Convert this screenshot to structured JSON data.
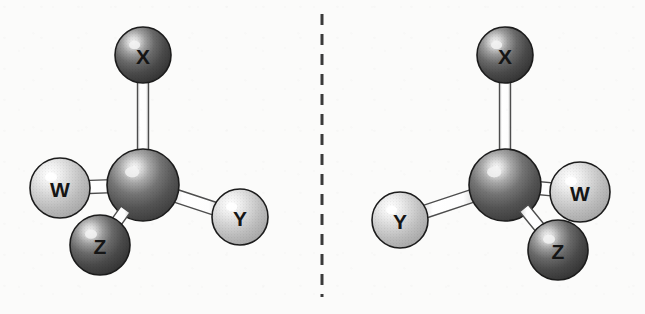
{
  "figure": {
    "type": "molecular-structure-pair",
    "background_color": "#fbfbfa",
    "divider": {
      "name": "mirror-plane",
      "style": "dashed",
      "orientation": "vertical",
      "color": "#3a3a3a",
      "x": 322,
      "y_start": 14,
      "y_end": 297,
      "dash": "11 9",
      "width": 3
    },
    "colors": {
      "dark_atom": "#4a4a4a",
      "dark_atom_highlight": "#f2f2f2",
      "light_atom": "#c9c9c9",
      "light_atom_highlight": "#ffffff",
      "central_atom": "#5d5d5d",
      "bond_fill": "#ffffff",
      "bond_stroke": "#4d4d4d",
      "outline": "#1c1c1c",
      "label_color": "#151515"
    },
    "molecules": [
      {
        "name": "molecule-left",
        "side": "left",
        "center_atom": {
          "name": "central-atom",
          "label": "",
          "cx": 143,
          "cy": 185,
          "r": 36,
          "shade": "central"
        },
        "atoms": [
          {
            "name": "atom-x",
            "label": "X",
            "cx": 143,
            "cy": 55,
            "r": 28,
            "shade": "dark",
            "font_size": 21
          },
          {
            "name": "atom-w",
            "label": "W",
            "cx": 60,
            "cy": 188,
            "r": 30,
            "shade": "light",
            "font_size": 21
          },
          {
            "name": "atom-z",
            "label": "Z",
            "cx": 100,
            "cy": 245,
            "r": 30,
            "shade": "dark",
            "font_size": 21
          },
          {
            "name": "atom-y",
            "label": "Y",
            "cx": 240,
            "cy": 217,
            "r": 28,
            "shade": "light",
            "font_size": 21
          }
        ],
        "bonds": [
          {
            "name": "bond-center-x",
            "from": "center",
            "to": "atom-x",
            "half_width": 5.5
          },
          {
            "name": "bond-center-w",
            "from": "center",
            "to": "atom-w",
            "half_width": 6.5
          },
          {
            "name": "bond-center-z",
            "from": "center",
            "to": "atom-z",
            "half_width": 5.5
          },
          {
            "name": "bond-center-y",
            "from": "center",
            "to": "atom-y",
            "half_width": 6.5
          }
        ],
        "draw_order": [
          "bond-center-x",
          "bond-center-w",
          "bond-center-y",
          "atom-w",
          "atom-y",
          "atom-x",
          "center",
          "bond-center-z",
          "atom-z"
        ]
      },
      {
        "name": "molecule-right",
        "side": "right",
        "center_atom": {
          "name": "central-atom",
          "label": "",
          "cx": 505,
          "cy": 185,
          "r": 36,
          "shade": "central"
        },
        "atoms": [
          {
            "name": "atom-x",
            "label": "X",
            "cx": 505,
            "cy": 55,
            "r": 28,
            "shade": "dark",
            "font_size": 21
          },
          {
            "name": "atom-w",
            "label": "W",
            "cx": 580,
            "cy": 192,
            "r": 30,
            "shade": "light",
            "font_size": 21
          },
          {
            "name": "atom-z",
            "label": "Z",
            "cx": 558,
            "cy": 250,
            "r": 30,
            "shade": "dark",
            "font_size": 21
          },
          {
            "name": "atom-y",
            "label": "Y",
            "cx": 400,
            "cy": 220,
            "r": 28,
            "shade": "light",
            "font_size": 21
          }
        ],
        "bonds": [
          {
            "name": "bond-center-x",
            "from": "center",
            "to": "atom-x",
            "half_width": 5.5
          },
          {
            "name": "bond-center-w",
            "from": "center",
            "to": "atom-w",
            "half_width": 6.5
          },
          {
            "name": "bond-center-z",
            "from": "center",
            "to": "atom-z",
            "half_width": 5.5
          },
          {
            "name": "bond-center-y",
            "from": "center",
            "to": "atom-y",
            "half_width": 6.5
          }
        ],
        "draw_order": [
          "bond-center-x",
          "bond-center-w",
          "bond-center-y",
          "atom-w",
          "atom-y",
          "atom-x",
          "center",
          "bond-center-z",
          "atom-z"
        ]
      }
    ]
  }
}
